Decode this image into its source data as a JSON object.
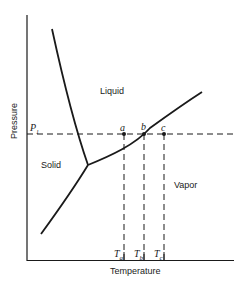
{
  "diagram": {
    "type": "phase diagram",
    "axes": {
      "xlabel": "Temperature",
      "ylabel": "Pressure"
    },
    "regions": {
      "liquid": "Liquid",
      "solid": "Solid",
      "vapor": "Vapor"
    },
    "pressure_line": {
      "label_main": "P",
      "label_sub": "1"
    },
    "points": [
      {
        "label": "a"
      },
      {
        "label": "b"
      },
      {
        "label": "c"
      }
    ],
    "temperature_ticks": [
      {
        "main": "T",
        "sub": "a"
      },
      {
        "main": "T",
        "sub": "b"
      },
      {
        "main": "T",
        "sub": "c"
      }
    ],
    "colors": {
      "line": "#1a1a1a",
      "background": "#ffffff"
    }
  }
}
